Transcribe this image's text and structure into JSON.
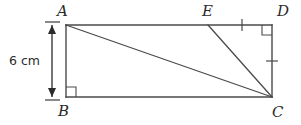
{
  "figure": {
    "name": "rectangle-abcd-with-diagonals",
    "type": "geometry-diagram",
    "stroke_color": "#4a4a4a",
    "text_color": "#2b2b2b",
    "background_color": "#ffffff",
    "vertices": {
      "A": {
        "label": "A",
        "x": 66,
        "y": 25
      },
      "B": {
        "label": "B",
        "x": 66,
        "y": 97
      },
      "C": {
        "label": "C",
        "x": 272,
        "y": 97
      },
      "D": {
        "label": "D",
        "x": 272,
        "y": 25
      },
      "E": {
        "label": "E",
        "x": 208,
        "y": 25
      }
    },
    "segments": [
      {
        "name": "AD",
        "from": "A",
        "to": "D"
      },
      {
        "name": "AB",
        "from": "A",
        "to": "B"
      },
      {
        "name": "BC",
        "from": "B",
        "to": "C"
      },
      {
        "name": "DC",
        "from": "D",
        "to": "C"
      },
      {
        "name": "AC",
        "from": "A",
        "to": "C"
      },
      {
        "name": "EC",
        "from": "E",
        "to": "C"
      }
    ],
    "right_angles": [
      {
        "name": "right-angle-at-B",
        "vertex": "B"
      },
      {
        "name": "right-angle-at-D",
        "vertex": "D"
      }
    ],
    "tick_marks": [
      {
        "name": "tick-on-ED",
        "segment": "ED",
        "count": 1,
        "orientation": "vertical"
      },
      {
        "name": "tick-on-DC",
        "segment": "DC",
        "count": 1,
        "orientation": "horizontal"
      }
    ],
    "dimension": {
      "name": "height-AB",
      "label": "6 cm",
      "value": 6,
      "unit": "cm",
      "measures": "AB",
      "arrow_style": "double-headed"
    }
  }
}
